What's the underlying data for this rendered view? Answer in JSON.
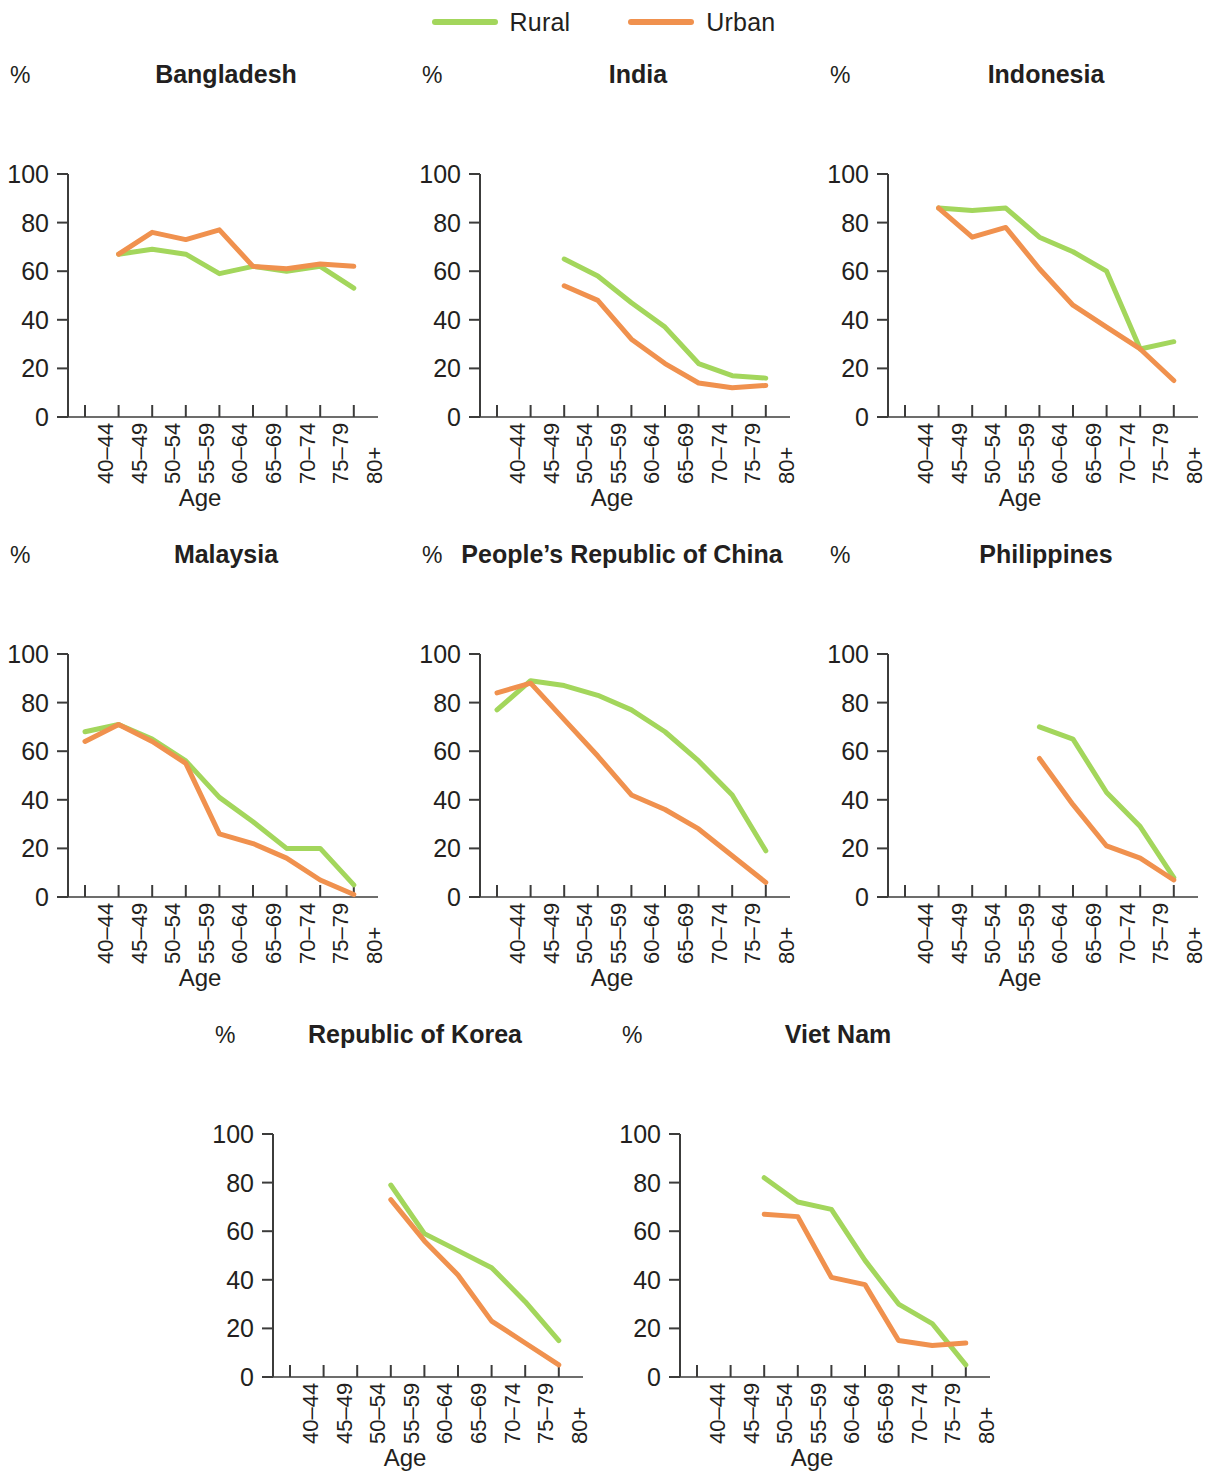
{
  "legend": {
    "entries": [
      {
        "label": "Rural",
        "color": "#a3d65c",
        "icon": "line-swatch-rural"
      },
      {
        "label": "Urban",
        "color": "#f0914e",
        "icon": "line-swatch-urban"
      }
    ]
  },
  "axis": {
    "y_unit": "%",
    "x_title": "Age",
    "y_ticks": [
      "0",
      "20",
      "40",
      "60",
      "80",
      "100"
    ],
    "x_ticks": [
      "40–44",
      "45–49",
      "50–54",
      "55–59",
      "60–64",
      "65–69",
      "70–74",
      "75–79",
      "80+"
    ]
  },
  "chart_data": {
    "type": "line",
    "title": "",
    "xlabel": "Age",
    "ylabel": "%",
    "ylim": [
      0,
      100
    ],
    "grid": false,
    "legend_position": "top-center",
    "categories": [
      "40–44",
      "45–49",
      "50–54",
      "55–59",
      "60–64",
      "65–69",
      "70–74",
      "75–79",
      "80+"
    ],
    "panels": [
      {
        "title": "Bangladesh",
        "series": [
          {
            "name": "Rural",
            "color": "#a3d65c",
            "values": [
              null,
              67,
              69,
              67,
              59,
              62,
              60,
              62,
              53
            ]
          },
          {
            "name": "Urban",
            "color": "#f0914e",
            "values": [
              null,
              67,
              76,
              73,
              77,
              62,
              61,
              63,
              62
            ]
          }
        ]
      },
      {
        "title": "India",
        "series": [
          {
            "name": "Rural",
            "color": "#a3d65c",
            "values": [
              null,
              null,
              65,
              58,
              47,
              37,
              22,
              17,
              16
            ]
          },
          {
            "name": "Urban",
            "color": "#f0914e",
            "values": [
              null,
              null,
              54,
              48,
              32,
              22,
              14,
              12,
              13
            ]
          }
        ]
      },
      {
        "title": "Indonesia",
        "series": [
          {
            "name": "Rural",
            "color": "#a3d65c",
            "values": [
              null,
              86,
              85,
              86,
              74,
              68,
              60,
              28,
              31
            ]
          },
          {
            "name": "Urban",
            "color": "#f0914e",
            "values": [
              null,
              86,
              74,
              78,
              61,
              46,
              37,
              28,
              15
            ]
          }
        ]
      },
      {
        "title": "Malaysia",
        "series": [
          {
            "name": "Rural",
            "color": "#a3d65c",
            "values": [
              68,
              71,
              65,
              56,
              41,
              31,
              20,
              20,
              5
            ]
          },
          {
            "name": "Urban",
            "color": "#f0914e",
            "values": [
              64,
              71,
              64,
              55,
              26,
              22,
              16,
              7,
              1
            ]
          }
        ]
      },
      {
        "title": "People’s Republic of China",
        "series": [
          {
            "name": "Rural",
            "color": "#a3d65c",
            "values": [
              77,
              89,
              87,
              83,
              77,
              68,
              56,
              42,
              19
            ]
          },
          {
            "name": "Urban",
            "color": "#f0914e",
            "values": [
              84,
              88,
              73,
              58,
              42,
              36,
              28,
              17,
              6
            ]
          }
        ]
      },
      {
        "title": "Philippines",
        "series": [
          {
            "name": "Rural",
            "color": "#a3d65c",
            "values": [
              null,
              null,
              null,
              null,
              70,
              65,
              43,
              29,
              8
            ]
          },
          {
            "name": "Urban",
            "color": "#f0914e",
            "values": [
              null,
              null,
              null,
              null,
              57,
              38,
              21,
              16,
              7
            ]
          }
        ]
      },
      {
        "title": "Republic of Korea",
        "series": [
          {
            "name": "Rural",
            "color": "#a3d65c",
            "values": [
              null,
              null,
              null,
              79,
              59,
              52,
              45,
              31,
              15
            ]
          },
          {
            "name": "Urban",
            "color": "#f0914e",
            "values": [
              null,
              null,
              null,
              73,
              56,
              42,
              23,
              14,
              5
            ]
          }
        ]
      },
      {
        "title": "Viet Nam",
        "series": [
          {
            "name": "Rural",
            "color": "#a3d65c",
            "values": [
              null,
              null,
              82,
              72,
              69,
              48,
              30,
              22,
              5
            ]
          },
          {
            "name": "Urban",
            "color": "#f0914e",
            "values": [
              null,
              null,
              67,
              66,
              41,
              38,
              15,
              13,
              14
            ]
          }
        ]
      }
    ]
  }
}
